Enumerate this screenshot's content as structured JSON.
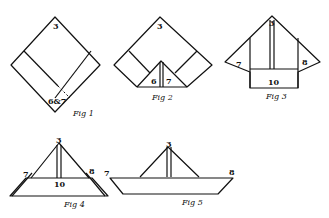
{
  "diagram": {
    "figures": [
      {
        "id": "fig1",
        "caption": "Fig 1",
        "labels": {
          "top": "3",
          "bottom": "6&7"
        }
      },
      {
        "id": "fig2",
        "caption": "Fig 2",
        "labels": {
          "top": "3",
          "left": "6",
          "right": "7"
        }
      },
      {
        "id": "fig3",
        "caption": "Fig 3",
        "labels": {
          "top": "3",
          "left": "7",
          "right": "8",
          "bottom": "10"
        }
      },
      {
        "id": "fig4",
        "caption": "Fig 4",
        "labels": {
          "top": "3",
          "left": "7",
          "right": "8",
          "center": "10"
        }
      },
      {
        "id": "fig5",
        "caption": "Fig 5",
        "labels": {
          "top": "3",
          "left": "7",
          "right": "8"
        }
      }
    ]
  }
}
